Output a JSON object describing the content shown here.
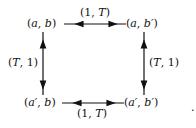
{
  "diagram": {
    "nodes": [
      {
        "id": "top-left",
        "label_parts": [
          "(",
          "a",
          ", ",
          "b",
          ")"
        ]
      },
      {
        "id": "top-right",
        "label_parts": [
          "(",
          "a",
          ", ",
          "b′",
          ")"
        ]
      },
      {
        "id": "bottom-left",
        "label_parts": [
          "(",
          "a′",
          ", ",
          "b",
          ")"
        ]
      },
      {
        "id": "bottom-right",
        "label_parts": [
          "(",
          "a′",
          ", ",
          "b′",
          ")"
        ]
      }
    ],
    "edges": [
      {
        "id": "top",
        "from": "top-left",
        "to": "top-right",
        "label_parts": [
          "(1, ",
          "T",
          ")"
        ],
        "bidirectional": true
      },
      {
        "id": "bottom",
        "from": "bottom-left",
        "to": "bottom-right",
        "label_parts": [
          "(1, ",
          "T",
          ")"
        ],
        "bidirectional": true
      },
      {
        "id": "left",
        "from": "top-left",
        "to": "bottom-left",
        "label_parts": [
          "(",
          "T",
          ", 1)"
        ],
        "bidirectional": true
      },
      {
        "id": "right",
        "from": "top-right",
        "to": "bottom-right",
        "label_parts": [
          "(",
          "T",
          ", 1)"
        ],
        "bidirectional": true
      }
    ],
    "trailing_mark": "."
  }
}
